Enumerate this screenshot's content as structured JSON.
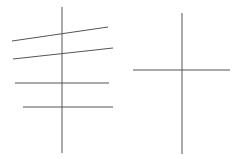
{
  "canvas": {
    "width": 241,
    "height": 159,
    "background": "#ffffff"
  },
  "stroke": {
    "color": "#555555",
    "width": 1
  },
  "figures": [
    {
      "name": "figure-left",
      "lines": [
        {
          "name": "vertical-axis",
          "x1": 62,
          "y1": 7,
          "x2": 62,
          "y2": 153
        },
        {
          "name": "slanted-line-1",
          "x1": 12,
          "y1": 41,
          "x2": 108,
          "y2": 27
        },
        {
          "name": "slanted-line-2",
          "x1": 13,
          "y1": 59,
          "x2": 113,
          "y2": 48
        },
        {
          "name": "horizontal-line-1",
          "x1": 15,
          "y1": 83,
          "x2": 109,
          "y2": 83
        },
        {
          "name": "horizontal-line-2",
          "x1": 23,
          "y1": 107,
          "x2": 113,
          "y2": 107
        }
      ]
    },
    {
      "name": "figure-right",
      "lines": [
        {
          "name": "vertical-axis",
          "x1": 182,
          "y1": 13,
          "x2": 182,
          "y2": 154
        },
        {
          "name": "horizontal-line",
          "x1": 133,
          "y1": 70,
          "x2": 230,
          "y2": 70
        }
      ]
    }
  ]
}
